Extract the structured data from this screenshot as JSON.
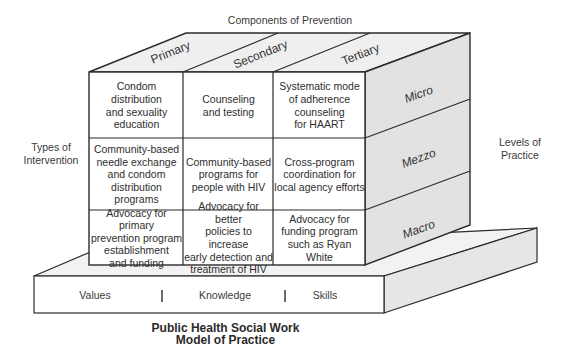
{
  "header": {
    "title": "Components of Prevention"
  },
  "components": [
    {
      "label": "Primary"
    },
    {
      "label": "Secondary"
    },
    {
      "label": "Tertiary"
    }
  ],
  "levels": {
    "title": "Levels of Practice",
    "items": [
      {
        "label": "Micro"
      },
      {
        "label": "Mezzo"
      },
      {
        "label": "Macro"
      }
    ]
  },
  "types_of_intervention": {
    "title": "Types of Intervention"
  },
  "cells": [
    [
      "Condom distribution and sexuality education",
      "Counseling and testing",
      "Systematic mode of adherence counseling for HAART"
    ],
    [
      "Community-based needle exchange and condom distribution programs",
      "Community-based programs for people with HIV",
      "Cross-program coordination for local agency efforts"
    ],
    [
      "Advocacy for primary prevention program establishment and funding",
      "Advocacy for better policies to increase early detection and treatment of HIV",
      "Advocacy for funding program such as Ryan White"
    ]
  ],
  "cell_lines": [
    [
      [
        "Condom",
        "distribution",
        "and sexuality",
        "education"
      ],
      [
        "Counseling",
        "and testing"
      ],
      [
        "Systematic mode",
        "of adherence",
        "counseling",
        "for HAART"
      ]
    ],
    [
      [
        "Community-based",
        "needle exchange",
        "and condom",
        "distribution",
        "programs"
      ],
      [
        "Community-based",
        "programs for",
        "people with HIV"
      ],
      [
        "Cross-program",
        "coordination for",
        "local agency efforts"
      ]
    ],
    [
      [
        "Advocacy for primary",
        "prevention program",
        "establishment",
        "and funding"
      ],
      [
        "Advocacy for better",
        "policies to increase",
        "early detection and",
        "treatment of HIV"
      ],
      [
        "Advocacy for",
        "funding program",
        "such as Ryan White"
      ]
    ]
  ],
  "foundation": {
    "items": [
      {
        "label": "Values"
      },
      {
        "label": "Knowledge"
      },
      {
        "label": "Skills"
      }
    ]
  },
  "footer": {
    "line1": "Public Health Social Work",
    "line2": "Model of Practice"
  },
  "colors": {
    "stroke": "#2b2b2b",
    "face_front": "#ffffff",
    "face_top": "#efefef",
    "face_side": "#e2e2e2",
    "base_top": "#f2f2f2",
    "base_side": "#e6e6e6"
  }
}
